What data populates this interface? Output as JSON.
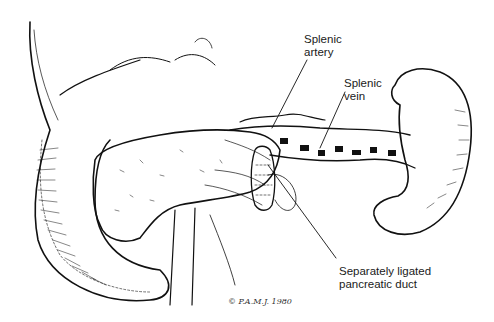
{
  "figure": {
    "labels": {
      "splenic_artery": [
        "Splenic",
        "artery"
      ],
      "splenic_vein": [
        "Splenic",
        "vein"
      ],
      "pancreatic_duct": [
        "Separately ligated",
        "pancreatic duct"
      ]
    },
    "signature": "© P.A.M.J. 1980",
    "colors": {
      "ink": "#111111",
      "background": "#ffffff"
    }
  }
}
